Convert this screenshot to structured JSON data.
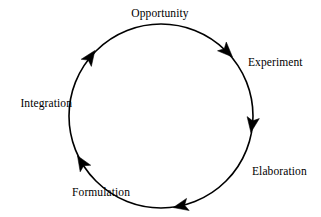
{
  "diagram": {
    "type": "cyclic-process-diagram",
    "title_text": null,
    "direction": "clockwise",
    "stroke_color": "#000000",
    "background_color": "#ffffff",
    "circle": {
      "center_x": 161,
      "center_y": 116,
      "radius": 92,
      "stroke_width": 1.6
    },
    "stages": [
      {
        "id": "opportunity",
        "label": "Opportunity",
        "position": "top",
        "label_x": 160,
        "label_y": 13,
        "align": "center",
        "arrow_angle_deg": 305
      },
      {
        "id": "experiment",
        "label": "Experiment",
        "position": "upper-right",
        "label_x": 248,
        "label_y": 62,
        "align": "left",
        "arrow_angle_deg": 300
      },
      {
        "id": "elaboration",
        "label": "Elaboration",
        "position": "lower-right",
        "label_x": 252,
        "label_y": 171,
        "align": "left",
        "arrow_angle_deg": 0
      },
      {
        "id": "formulation",
        "label": "Formulation",
        "position": "bottom-left",
        "label_x": 130,
        "label_y": 192,
        "align": "right",
        "arrow_angle_deg": 60
      },
      {
        "id": "integration",
        "label": "Integration",
        "position": "left",
        "label_x": 72,
        "label_y": 103,
        "align": "right",
        "arrow_angle_deg": 120
      }
    ],
    "arrowheads": [
      {
        "id": "arrow-upper-right",
        "angle_deg": -55,
        "points_toward": "experiment"
      },
      {
        "id": "arrow-right",
        "angle_deg": 9,
        "points_toward": "elaboration"
      },
      {
        "id": "arrow-bottom",
        "angle_deg": 78,
        "points_toward": "formulation"
      },
      {
        "id": "arrow-lower-left",
        "angle_deg": 148,
        "points_toward": "integration"
      },
      {
        "id": "arrow-upper-left",
        "angle_deg": 215,
        "points_toward": "opportunity"
      }
    ]
  }
}
